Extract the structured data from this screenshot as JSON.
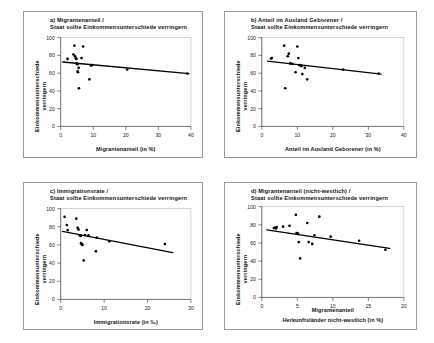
{
  "figure": {
    "background": "#ffffff",
    "point_color": "#000000",
    "trend_color": "#000000",
    "axis_color": "#4a4a4a"
  },
  "common": {
    "ylabel_line1": "Einkommensunterschiede",
    "ylabel_line2": "verringern",
    "subtitle": "Staat sollte Einkommensunterschiede verringern",
    "yticks": [
      "0",
      "20",
      "40",
      "60",
      "80",
      "100"
    ]
  },
  "chart_data": [
    {
      "id": "panel-a",
      "type": "scatter",
      "title_line1": "a) Migrantenanteil /",
      "title_line2": "Staat sollte Einkommensunterschiede verringern",
      "xlabel": "Migrantenanteil (in %)",
      "ylabel": "Einkommensunterschiede verringern",
      "xlim": [
        0,
        40
      ],
      "ylim": [
        0,
        100
      ],
      "xticks": [
        "0",
        "10",
        "20",
        "30",
        "40"
      ],
      "yticks": [
        "0",
        "20",
        "40",
        "60",
        "80",
        "100"
      ],
      "grid": false,
      "legend": "none",
      "x": [
        2.1,
        3.9,
        4.2,
        4.4,
        4.6,
        4.7,
        4.8,
        4.9,
        5.0,
        5.1,
        5.2,
        5.3,
        5.5,
        5.6,
        6.4,
        6.9,
        8.8,
        9.3,
        9.6,
        20.4,
        38.9
      ],
      "y": [
        76.0,
        81.0,
        91.0,
        79.0,
        77.0,
        76.5,
        76.0,
        71.0,
        70.5,
        70.0,
        62.0,
        61.0,
        66.0,
        43.0,
        77.0,
        90.0,
        53.0,
        68.5,
        69.0,
        64.0,
        59.5
      ],
      "trend": {
        "x0": 0.6,
        "y0": 72.6,
        "x1": 39.4,
        "y1": 59.4
      }
    },
    {
      "id": "panel-b",
      "type": "scatter",
      "title_line1": "b) Anteil im Ausland Geborener /",
      "title_line2": "Staat sollte Einkommensunterschiede verringern",
      "xlabel": "Anteil im Ausland Geborener (in %)",
      "ylabel": "Einkommensunterschiede verringern",
      "xlim": [
        0,
        40
      ],
      "ylim": [
        0,
        100
      ],
      "xticks": [
        "0",
        "10",
        "20",
        "30",
        "40"
      ],
      "yticks": [
        "0",
        "20",
        "40",
        "60",
        "80",
        "100"
      ],
      "grid": false,
      "legend": "none",
      "x": [
        2.6,
        2.8,
        6.3,
        6.6,
        7.3,
        7.6,
        8.0,
        8.6,
        9.5,
        10.0,
        10.3,
        10.6,
        11.0,
        11.2,
        11.4,
        12.1,
        12.8,
        22.9,
        32.9
      ],
      "y": [
        76.5,
        77.0,
        91.0,
        43.0,
        79.0,
        82.0,
        71.0,
        70.5,
        61.0,
        90.0,
        77.0,
        69.0,
        68.5,
        68.0,
        59.0,
        66.0,
        53.0,
        64.0,
        59.5
      ],
      "trend": {
        "x0": 1.6,
        "y0": 73.5,
        "x1": 33.6,
        "y1": 59.0
      }
    },
    {
      "id": "panel-c",
      "type": "scatter",
      "title_line1": "c) Immigrationsrate /",
      "title_line2": "Staat sollte Einkommensunterschiede verringern",
      "xlabel": "Immigrationsrate (in ‰)",
      "ylabel": "Einkommensunterschiede verringern",
      "xlim": [
        0,
        30
      ],
      "ylim": [
        0,
        100
      ],
      "xticks": [
        "0",
        "10",
        "20",
        "30"
      ],
      "yticks": [
        "0",
        "20",
        "40",
        "60",
        "80",
        "100"
      ],
      "grid": false,
      "legend": "none",
      "x": [
        0.9,
        1.4,
        1.6,
        3.6,
        3.9,
        4.1,
        4.4,
        4.6,
        4.7,
        4.8,
        4.9,
        5.0,
        5.3,
        5.6,
        6.0,
        6.4,
        8.1,
        8.3,
        11.2,
        24.0
      ],
      "y": [
        91.0,
        82.0,
        76.5,
        89.0,
        79.0,
        77.0,
        70.5,
        70.0,
        62.0,
        61.0,
        60.5,
        60.0,
        43.0,
        71.0,
        76.5,
        70.5,
        53.0,
        68.0,
        64.0,
        61.0
      ],
      "trend": {
        "x0": 0.4,
        "y0": 75.0,
        "x1": 25.8,
        "y1": 51.6
      }
    },
    {
      "id": "panel-d",
      "type": "scatter",
      "title_line1": "d) Migrantenanteil (nicht-westlich) /",
      "title_line2": "Staat sollte Einkommensunterschiede verringern",
      "xlabel_line1": "Migrantenanteil",
      "xlabel_line2": "Herkunftsländer nicht-westlich (in %)",
      "ylabel": "Einkommensunterschiede verringern",
      "xlim": [
        0,
        20
      ],
      "ylim": [
        0,
        100
      ],
      "xticks": [
        "0",
        "5",
        "10",
        "15",
        "20"
      ],
      "yticks": [
        "0",
        "20",
        "40",
        "60",
        "80",
        "100"
      ],
      "grid": false,
      "legend": "none",
      "x": [
        1.7,
        1.9,
        2.0,
        2.1,
        3.0,
        3.9,
        4.8,
        4.9,
        5.0,
        5.1,
        5.2,
        5.4,
        6.4,
        6.6,
        7.1,
        7.4,
        8.1,
        9.7,
        13.7,
        17.4
      ],
      "y": [
        76.5,
        77.0,
        76.0,
        77.5,
        78.0,
        79.0,
        91.0,
        71.0,
        70.5,
        70.0,
        61.0,
        43.0,
        82.0,
        61.0,
        59.0,
        68.5,
        89.0,
        67.0,
        62.5,
        52.5
      ],
      "trend": {
        "x0": 0.7,
        "y0": 74.5,
        "x1": 18.0,
        "y1": 54.0
      }
    }
  ]
}
